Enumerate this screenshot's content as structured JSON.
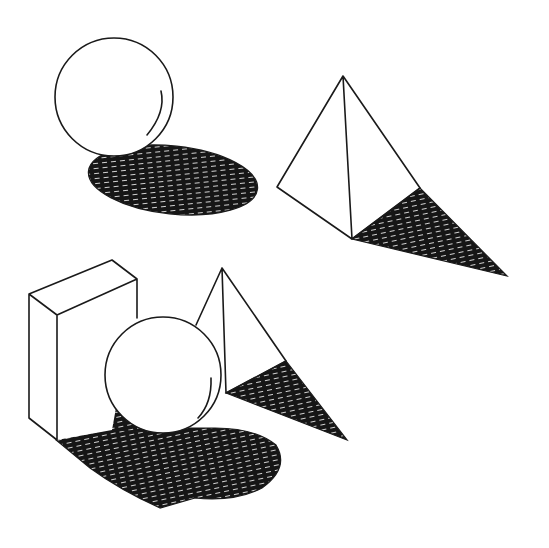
{
  "figure": {
    "colors": {
      "ink": "#1a1a1a",
      "paper": "#ffffff",
      "shadow": "#161616"
    },
    "groups": [
      {
        "name": "sphere-with-shadow",
        "objects": [
          "sphere",
          "elliptical-cast-shadow"
        ]
      },
      {
        "name": "pyramid-with-shadow",
        "objects": [
          "triangular-pyramid",
          "triangular-cast-shadow"
        ]
      },
      {
        "name": "still-life-composition",
        "objects": [
          "rectangular-box",
          "sphere",
          "triangular-pyramid",
          "combined-cast-shadow"
        ]
      }
    ]
  }
}
